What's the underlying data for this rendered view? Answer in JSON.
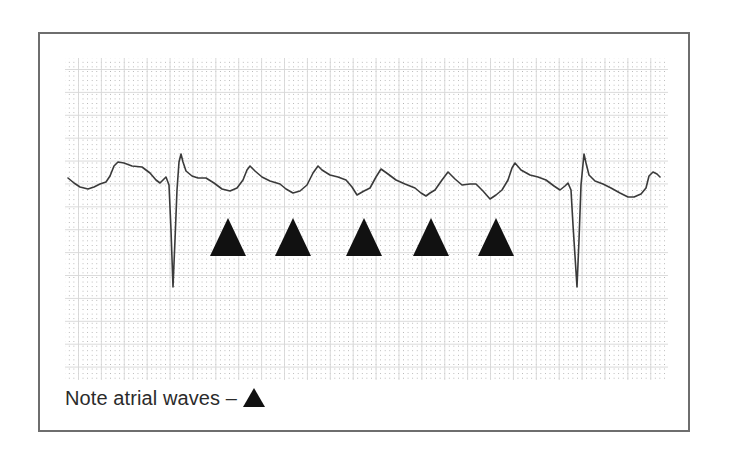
{
  "figure": {
    "caption": {
      "text": "Note atrial waves –",
      "marker_icon": "filled-triangle-icon"
    },
    "colors": {
      "frame_border": "#6e6e6e",
      "trace": "#3a3a3a",
      "marker": "#111111",
      "grid_line": "#d7d7d7",
      "grid_dot": "#969696",
      "caption_text": "#2b2b2b"
    },
    "ecg_strip": {
      "grid": {
        "x": 65,
        "y": 58,
        "width": 603,
        "height": 322,
        "major_cell_px": 22.9,
        "dots_per_cell": 5
      },
      "trace_points": [
        [
          68,
          178
        ],
        [
          74,
          183
        ],
        [
          80,
          187
        ],
        [
          88,
          189
        ],
        [
          94,
          187
        ],
        [
          100,
          184
        ],
        [
          106,
          182
        ],
        [
          110,
          176
        ],
        [
          114,
          166
        ],
        [
          118,
          162
        ],
        [
          124,
          163
        ],
        [
          132,
          166
        ],
        [
          142,
          167
        ],
        [
          150,
          173
        ],
        [
          156,
          180
        ],
        [
          160,
          183
        ],
        [
          163,
          180
        ],
        [
          166,
          177
        ],
        [
          169,
          185
        ],
        [
          171,
          230
        ],
        [
          173,
          287
        ],
        [
          175,
          240
        ],
        [
          177,
          190
        ],
        [
          179,
          162
        ],
        [
          181,
          154
        ],
        [
          183,
          162
        ],
        [
          186,
          171
        ],
        [
          192,
          176
        ],
        [
          198,
          178
        ],
        [
          206,
          178
        ],
        [
          214,
          183
        ],
        [
          222,
          189
        ],
        [
          230,
          191
        ],
        [
          237,
          188
        ],
        [
          243,
          180
        ],
        [
          247,
          170
        ],
        [
          250,
          166
        ],
        [
          255,
          171
        ],
        [
          262,
          177
        ],
        [
          270,
          181
        ],
        [
          280,
          184
        ],
        [
          286,
          189
        ],
        [
          293,
          193
        ],
        [
          300,
          191
        ],
        [
          307,
          185
        ],
        [
          313,
          173
        ],
        [
          318,
          166
        ],
        [
          322,
          170
        ],
        [
          330,
          175
        ],
        [
          338,
          177
        ],
        [
          346,
          180
        ],
        [
          352,
          187
        ],
        [
          357,
          195
        ],
        [
          364,
          191
        ],
        [
          370,
          188
        ],
        [
          376,
          177
        ],
        [
          381,
          169
        ],
        [
          388,
          174
        ],
        [
          396,
          180
        ],
        [
          405,
          184
        ],
        [
          415,
          188
        ],
        [
          421,
          193
        ],
        [
          426,
          196
        ],
        [
          430,
          193
        ],
        [
          435,
          190
        ],
        [
          442,
          180
        ],
        [
          448,
          172
        ],
        [
          455,
          179
        ],
        [
          462,
          185
        ],
        [
          470,
          184
        ],
        [
          476,
          184
        ],
        [
          483,
          191
        ],
        [
          490,
          199
        ],
        [
          496,
          195
        ],
        [
          502,
          190
        ],
        [
          508,
          180
        ],
        [
          512,
          168
        ],
        [
          515,
          163
        ],
        [
          521,
          170
        ],
        [
          530,
          175
        ],
        [
          538,
          177
        ],
        [
          546,
          180
        ],
        [
          554,
          186
        ],
        [
          560,
          190
        ],
        [
          565,
          186
        ],
        [
          568,
          183
        ],
        [
          571,
          190
        ],
        [
          573,
          225
        ],
        [
          577,
          287
        ],
        [
          579,
          240
        ],
        [
          581,
          185
        ],
        [
          584,
          154
        ],
        [
          586,
          163
        ],
        [
          589,
          175
        ],
        [
          595,
          181
        ],
        [
          603,
          184
        ],
        [
          611,
          188
        ],
        [
          620,
          193
        ],
        [
          628,
          197
        ],
        [
          634,
          197
        ],
        [
          641,
          194
        ],
        [
          646,
          188
        ],
        [
          649,
          176
        ],
        [
          653,
          172
        ],
        [
          657,
          174
        ],
        [
          660,
          177
        ]
      ],
      "qrs_complexes": [
        {
          "q_trough": [
            173,
            287
          ],
          "r_peak": [
            181,
            154
          ]
        },
        {
          "q_trough": [
            577,
            287
          ],
          "r_peak": [
            584,
            154
          ]
        }
      ],
      "atrial_wave_markers": [
        {
          "label": "atrial-wave-1",
          "apex": [
            228,
            218
          ],
          "left": [
            210,
            256
          ],
          "right": [
            246,
            256
          ]
        },
        {
          "label": "atrial-wave-2",
          "apex": [
            293,
            218
          ],
          "left": [
            275,
            256
          ],
          "right": [
            311,
            256
          ]
        },
        {
          "label": "atrial-wave-3",
          "apex": [
            364,
            218
          ],
          "left": [
            346,
            256
          ],
          "right": [
            382,
            256
          ]
        },
        {
          "label": "atrial-wave-4",
          "apex": [
            431,
            218
          ],
          "left": [
            413,
            256
          ],
          "right": [
            449,
            256
          ]
        },
        {
          "label": "atrial-wave-5",
          "apex": [
            496,
            218
          ],
          "left": [
            478,
            256
          ],
          "right": [
            514,
            256
          ]
        }
      ]
    }
  }
}
